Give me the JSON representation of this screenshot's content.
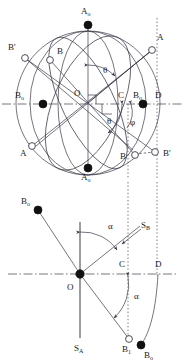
{
  "figure": {
    "domain": "diagram",
    "width": 184,
    "height": 362,
    "background": "#ffffff",
    "line_color": "#3a3a4a",
    "marker_fill_solid": "#111111",
    "marker_fill_open": "#ffffff"
  },
  "upper_panel": {
    "name": "sphere-projection-panel",
    "description": "Great-circle sphere with pole A0, points A, B, B', B0 and angles theta, phi",
    "center": {
      "label": "O",
      "x": 88,
      "y": 103
    },
    "sphere": {
      "cx": 88,
      "cy": 103,
      "rx": 72,
      "ry": 72
    },
    "labels": [
      {
        "id": "A0-top",
        "text": "A",
        "sub": "o",
        "x": 84,
        "y": 11
      },
      {
        "id": "A-right",
        "text": "A",
        "sub": "",
        "x": 155,
        "y": 38
      },
      {
        "id": "Bprime-left",
        "text": "B'",
        "sub": "",
        "x": 10,
        "y": 48
      },
      {
        "id": "B-left",
        "text": "B",
        "sub": "",
        "x": 45,
        "y": 52
      },
      {
        "id": "B0-left",
        "text": "B",
        "sub": "o",
        "x": 18,
        "y": 95
      },
      {
        "id": "O-center",
        "text": "O",
        "sub": "",
        "x": 78,
        "y": 93
      },
      {
        "id": "C-right",
        "text": "C",
        "sub": "",
        "x": 122,
        "y": 95
      },
      {
        "id": "B0-right",
        "text": "B",
        "sub": "o",
        "x": 137,
        "y": 95
      },
      {
        "id": "D-right",
        "text": "D",
        "sub": "",
        "x": 158,
        "y": 95
      },
      {
        "id": "theta-upper",
        "text": "θ",
        "sub": "",
        "x": 106,
        "y": 71
      },
      {
        "id": "theta-lower",
        "text": "θ",
        "sub": "",
        "x": 110,
        "y": 121
      },
      {
        "id": "phi-lower",
        "text": "φ",
        "sub": "",
        "x": 131,
        "y": 122
      },
      {
        "id": "B-bottom",
        "text": "B",
        "sub": "",
        "x": 122,
        "y": 155
      },
      {
        "id": "Bprime-bottom",
        "text": "B'",
        "sub": "",
        "x": 162,
        "y": 153
      },
      {
        "id": "A-bottomleft",
        "text": "A",
        "sub": "",
        "x": 24,
        "y": 152
      },
      {
        "id": "A0-bottom",
        "text": "A",
        "sub": "o",
        "x": 84,
        "y": 176
      }
    ],
    "markers": [
      {
        "id": "A0-top-marker",
        "kind": "solid",
        "x": 88,
        "y": 25
      },
      {
        "id": "A0-bottom-marker",
        "kind": "solid",
        "x": 88,
        "y": 168
      },
      {
        "id": "B0-left-marker",
        "kind": "solid",
        "x": 43,
        "y": 104
      },
      {
        "id": "B0-right-marker",
        "kind": "solid",
        "x": 143,
        "y": 104
      },
      {
        "id": "A-right-marker",
        "kind": "open",
        "x": 152,
        "y": 50
      },
      {
        "id": "Bprime-left-marker",
        "kind": "open",
        "x": 25,
        "y": 58
      },
      {
        "id": "B-left-marker",
        "kind": "open",
        "x": 50,
        "y": 60
      },
      {
        "id": "A-bottomleft-marker",
        "kind": "open",
        "x": 32,
        "y": 146
      },
      {
        "id": "B-bottom-marker",
        "kind": "open",
        "x": 135,
        "y": 155
      },
      {
        "id": "Bprime-bottom-marker",
        "kind": "open",
        "x": 155,
        "y": 152
      }
    ],
    "angles": [
      {
        "id": "theta-upper-arc",
        "symbol": "θ",
        "vertex": "O",
        "from_ray": "vertical-axis-A0",
        "to_ray": "OA"
      },
      {
        "id": "theta-lower-arc",
        "symbol": "θ",
        "vertex": "O",
        "from_ray": "horizontal-axis-OC",
        "to_ray": "OB"
      },
      {
        "id": "phi-arc",
        "symbol": "φ",
        "vertex": "C",
        "from_ray": "horizontal-axis",
        "to_ray": "CB"
      }
    ]
  },
  "lower_panel": {
    "name": "projection-plane-panel",
    "description": "Planar projection showing traces S_A and S_B with rotation angle alpha",
    "center": {
      "label": "O",
      "x": 80,
      "y": 274
    },
    "labels": [
      {
        "id": "B0-upperleft",
        "text": "B",
        "sub": "o",
        "x": 24,
        "y": 200
      },
      {
        "id": "alpha-upper",
        "text": "α",
        "sub": "",
        "x": 110,
        "y": 226
      },
      {
        "id": "SB",
        "text": "S",
        "sub": "B",
        "x": 142,
        "y": 228
      },
      {
        "id": "C-lower",
        "text": "C",
        "sub": "",
        "x": 122,
        "y": 264
      },
      {
        "id": "D-lower",
        "text": "D",
        "sub": "",
        "x": 158,
        "y": 264
      },
      {
        "id": "O-lower",
        "text": "O",
        "sub": "",
        "x": 70,
        "y": 288
      },
      {
        "id": "alpha-lower",
        "text": "α",
        "sub": "",
        "x": 136,
        "y": 296
      },
      {
        "id": "SA",
        "text": "S",
        "sub": "A",
        "x": 77,
        "y": 348
      },
      {
        "id": "B1-bottom",
        "text": "B",
        "sub": "1",
        "x": 126,
        "y": 349
      },
      {
        "id": "B0-bottom",
        "text": "B",
        "sub": "o",
        "x": 147,
        "y": 355
      }
    ],
    "markers": [
      {
        "id": "B0-upperleft-marker",
        "kind": "solid",
        "x": 38,
        "y": 210
      },
      {
        "id": "O-lower-marker",
        "kind": "solid",
        "x": 80,
        "y": 274
      },
      {
        "id": "B1-bottom-marker",
        "kind": "open",
        "x": 129,
        "y": 339
      },
      {
        "id": "B0-bottom-marker",
        "kind": "solid",
        "x": 141,
        "y": 345
      }
    ],
    "angles": [
      {
        "id": "alpha-upper-arc",
        "symbol": "α",
        "vertex": "O",
        "from_ray": "vertical-axis-up",
        "to_ray": "O-SB"
      },
      {
        "id": "alpha-lower-arc",
        "symbol": "α",
        "vertex": "B1",
        "from_ray": "vertical-dotted-C",
        "to_ray": "B1-O"
      }
    ]
  },
  "legend_symbols": {
    "solid_circle": "●",
    "open_circle": "○"
  }
}
